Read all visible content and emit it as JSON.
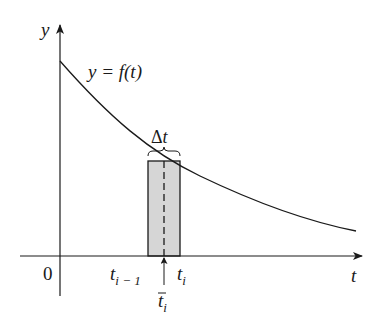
{
  "figure": {
    "y_axis_label": "y",
    "x_axis_label": "t",
    "origin_label": "0",
    "curve_label": "y = f(t)",
    "width_label": "Δt",
    "left_endpoint_label": {
      "base": "t",
      "sub": "i − 1"
    },
    "right_endpoint_label": {
      "base": "t",
      "sub": "i"
    },
    "sample_point_label": {
      "base": "t",
      "sub": "i",
      "overline": true
    },
    "colors": {
      "ink": "#1a1a1a",
      "rect_fill": "#d6d6d6",
      "background": "#ffffff"
    }
  }
}
